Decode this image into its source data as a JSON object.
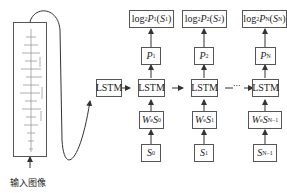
{
  "diagram": {
    "title": "",
    "input_label": "输入图像",
    "initial_lstm": "LSTM",
    "ellipsis": "···",
    "columns": [
      {
        "id": "1",
        "output": {
          "prefix": "log",
          "base": "2",
          "p": "P",
          "p_sub": "1",
          "s": "S",
          "s_sub": "1"
        },
        "prob": {
          "p": "P",
          "sub": "1"
        },
        "lstm": "LSTM",
        "embed": {
          "w": "W",
          "w_sub": "e",
          "s": "S",
          "s_sub": "0"
        },
        "word": {
          "s": "S",
          "sub": "0"
        }
      },
      {
        "id": "2",
        "output": {
          "prefix": "log",
          "base": "2",
          "p": "P",
          "p_sub": "2",
          "s": "S",
          "s_sub": "2"
        },
        "prob": {
          "p": "P",
          "sub": "2"
        },
        "lstm": "LSTM",
        "embed": {
          "w": "W",
          "w_sub": "e",
          "s": "S",
          "s_sub": "1"
        },
        "word": {
          "s": "S",
          "sub": "1"
        }
      },
      {
        "id": "N",
        "output": {
          "prefix": "log",
          "base": "2",
          "p": "P",
          "p_sub": "N",
          "s": "S",
          "s_sub": "N"
        },
        "prob": {
          "p": "P",
          "sub": "N"
        },
        "lstm": "LSTM",
        "embed": {
          "w": "W",
          "w_sub": "e",
          "s": "S",
          "s_sub": "N−1"
        },
        "word": {
          "s": "S",
          "sub": "N−1"
        }
      }
    ],
    "colors": {
      "stroke": "#555555",
      "text": "#222222",
      "background": "#ffffff"
    }
  }
}
